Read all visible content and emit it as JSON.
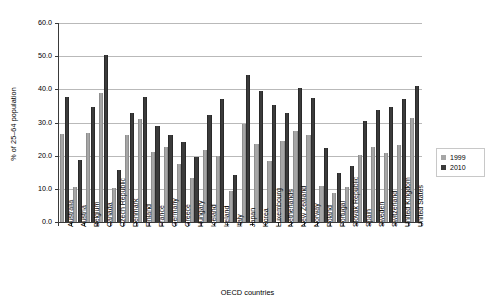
{
  "chart_data": {
    "type": "bar",
    "title": "",
    "xlabel": "OECD countries",
    "ylabel": "% of 25–64 population",
    "ylim": [
      0,
      60
    ],
    "ytick_step": 10,
    "ytick_labels": [
      "0.0",
      "10.0",
      "20.0",
      "30.0",
      "40.0",
      "50.0",
      "60.0"
    ],
    "grid": true,
    "legend_position": "right",
    "categories": [
      "Australia",
      "Austria",
      "Belgium",
      "Canada",
      "Czech Republic",
      "Denmark",
      "Finland",
      "France",
      "Germany",
      "Greece",
      "Hungary",
      "Iceland",
      "Ireland",
      "Italy",
      "Japan",
      "Korea",
      "Luxembourg",
      "Netherlands",
      "New Zealand",
      "Norway",
      "Poland",
      "Portugal",
      "Slovak Republic",
      "Spain",
      "Sweden",
      "Switzerland",
      "United Kingdom",
      "United States"
    ],
    "series": [
      {
        "name": "1999",
        "color": "#a6a6a6",
        "values": [
          26.6,
          10.5,
          26.7,
          39.0,
          10.4,
          26.2,
          31.0,
          21.1,
          22.5,
          17.5,
          13.4,
          21.8,
          19.9,
          9.4,
          29.7,
          23.6,
          18.3,
          24.4,
          27.5,
          26.2,
          10.8,
          8.6,
          10.5,
          20.2,
          22.6,
          20.7,
          23.2,
          31.4
        ]
      },
      {
        "name": "2010",
        "color": "#3b3b3b",
        "values": [
          37.6,
          18.8,
          34.8,
          50.3,
          15.8,
          33.0,
          37.8,
          28.9,
          26.3,
          24.2,
          19.5,
          32.3,
          37.1,
          14.2,
          44.3,
          39.6,
          35.3,
          32.8,
          40.4,
          37.3,
          22.2,
          14.7,
          16.8,
          30.6,
          33.9,
          34.8,
          37.2,
          41.0
        ]
      }
    ]
  },
  "legend": {
    "entries": [
      {
        "label": "1999"
      },
      {
        "label": "2010"
      }
    ]
  }
}
